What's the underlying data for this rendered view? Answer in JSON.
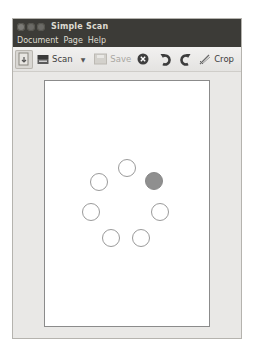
{
  "window": {
    "title": "Simple Scan",
    "controls": [
      "close",
      "minimize",
      "maximize"
    ]
  },
  "menubar": {
    "items": [
      {
        "label": "Document"
      },
      {
        "label": "Page"
      },
      {
        "label": "Help"
      }
    ]
  },
  "toolbar": {
    "scan_type_icon": "scanner-type-icon",
    "scan_label": "Scan",
    "scan_dropdown_icon": "chevron-down-icon",
    "save_label": "Save",
    "save_enabled": false,
    "stop_icon": "stop-icon",
    "rotate_left_icon": "rotate-left-icon",
    "rotate_right_icon": "rotate-right-icon",
    "crop_label": "Crop"
  },
  "preview": {
    "state": "scanning",
    "spinner": {
      "dots": 7,
      "active_index": 2,
      "active_color": "#8f8f8f",
      "inactive_color": "#ffffff"
    }
  },
  "colors": {
    "titlebar": "#3c3b37",
    "toolbar": "#f2f1f0",
    "content_bg": "#e9e8e6",
    "page": "#ffffff"
  }
}
